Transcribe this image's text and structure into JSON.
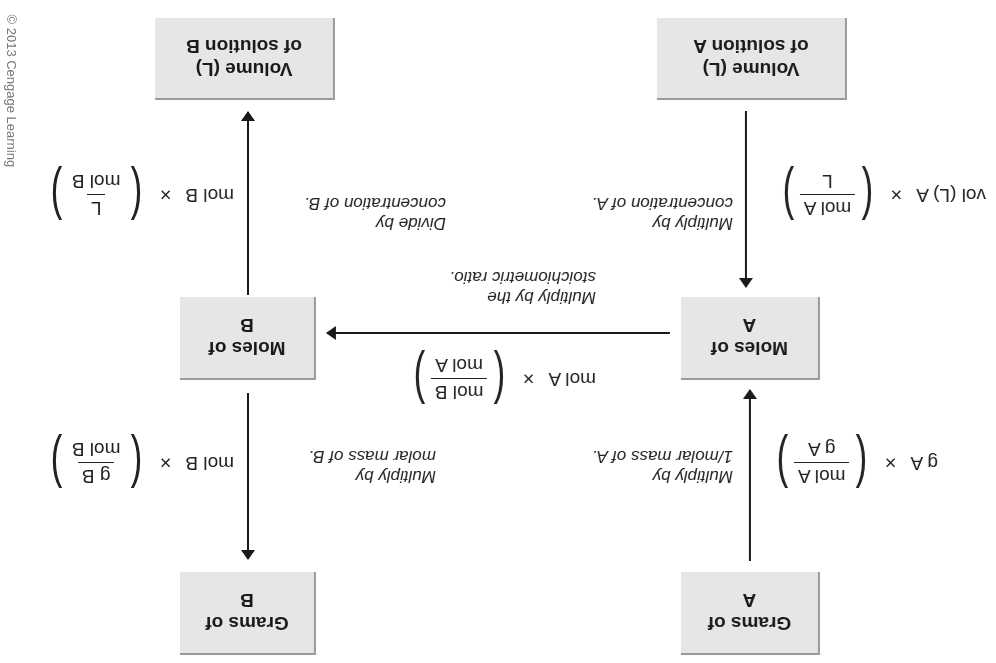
{
  "boxes": {
    "volume_a": {
      "line1": "Volume (L)",
      "line2": "of solution A"
    },
    "volume_b": {
      "line1": "Volume (L)",
      "line2": "of solution B"
    },
    "moles_a": {
      "line1": "Moles of",
      "line2": "A"
    },
    "moles_b": {
      "line1": "Moles of",
      "line2": "B"
    },
    "grams_a": {
      "line1": "Grams of",
      "line2": "A"
    },
    "grams_b": {
      "line1": "Grams of",
      "line2": "B"
    }
  },
  "notes": {
    "vol_a_to_mol_a": {
      "line1": "Multiply by",
      "line2": "concentration of A."
    },
    "mol_b_to_vol_b": {
      "line1": "Divide by",
      "line2": "concentration of B."
    },
    "mol_a_to_mol_b": {
      "line1": "Multiply by the",
      "line2": "stoichiometric ratio."
    },
    "grams_a_to_mol_a": {
      "line1": "Multiply by",
      "line2": "1/molar mass of A."
    },
    "mol_b_to_grams_b": {
      "line1": "Multiply by",
      "line2": "molar mass of B."
    }
  },
  "formulas": {
    "vol_a_to_mol_a": {
      "lhs": "vol (L) A",
      "times": "×",
      "num": "mol A",
      "den": "L"
    },
    "mol_b_to_vol_b": {
      "lhs": "mol B",
      "times": "×",
      "num": "L",
      "den": "mol B"
    },
    "mol_a_to_mol_b": {
      "lhs": "mol A",
      "times": "×",
      "num": "mol B",
      "den": "mol A"
    },
    "grams_a_to_mol_a": {
      "lhs": "g A",
      "times": "×",
      "num": "mol A",
      "den": "g A"
    },
    "mol_b_to_grams_b": {
      "lhs": "mol B",
      "times": "×",
      "num": "g B",
      "den": "mol B"
    }
  },
  "parens": {
    "open": "(",
    "close": ")"
  },
  "copyright": "© 2013 Cengage Learning",
  "colors": {
    "box_fill": "#e6e6e6",
    "box_border": "#9a9a9a",
    "text": "#1a1a1a",
    "arrow": "#1a1a1a",
    "copyright": "#777777"
  }
}
